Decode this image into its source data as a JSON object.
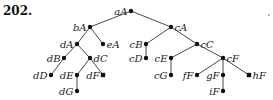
{
  "problem_number": "202.",
  "tree": {
    "nodes": [
      {
        "id": "aA",
        "label": "aA",
        "x": 131,
        "y": 11,
        "side": "left",
        "shape": "dot"
      },
      {
        "id": "bA",
        "label": "bA",
        "x": 90,
        "y": 27,
        "side": "left",
        "shape": "dot"
      },
      {
        "id": "cA",
        "label": "cA",
        "x": 171,
        "y": 27,
        "side": "right",
        "shape": "dot"
      },
      {
        "id": "dA",
        "label": "dA",
        "x": 77,
        "y": 44,
        "side": "left",
        "shape": "dot"
      },
      {
        "id": "eA",
        "label": "eA",
        "x": 103,
        "y": 44,
        "side": "right",
        "shape": "dot"
      },
      {
        "id": "cB",
        "label": "cB",
        "x": 146,
        "y": 44,
        "side": "left",
        "shape": "dot"
      },
      {
        "id": "cC",
        "label": "cC",
        "x": 197,
        "y": 44,
        "side": "right",
        "shape": "dot"
      },
      {
        "id": "dB",
        "label": "dB",
        "x": 64,
        "y": 58,
        "side": "left",
        "shape": "dot"
      },
      {
        "id": "dC",
        "label": "dC",
        "x": 90,
        "y": 58,
        "side": "right",
        "shape": "dot"
      },
      {
        "id": "cD",
        "label": "cD",
        "x": 146,
        "y": 58,
        "side": "left",
        "shape": "dot"
      },
      {
        "id": "cE",
        "label": "cE",
        "x": 171,
        "y": 58,
        "side": "left",
        "shape": "dot"
      },
      {
        "id": "cF",
        "label": "cF",
        "x": 223,
        "y": 58,
        "side": "right",
        "shape": "dot"
      },
      {
        "id": "dD",
        "label": "dD",
        "x": 51,
        "y": 75,
        "side": "left",
        "shape": "dot"
      },
      {
        "id": "dE",
        "label": "dE",
        "x": 77,
        "y": 75,
        "side": "left",
        "shape": "dot"
      },
      {
        "id": "dF",
        "label": "dF",
        "x": 103,
        "y": 75,
        "side": "left",
        "shape": "square"
      },
      {
        "id": "cG",
        "label": "cG",
        "x": 171,
        "y": 75,
        "side": "left",
        "shape": "dot"
      },
      {
        "id": "fF",
        "label": "fF",
        "x": 197,
        "y": 75,
        "side": "left",
        "shape": "dot"
      },
      {
        "id": "gF",
        "label": "gF",
        "x": 223,
        "y": 75,
        "side": "left",
        "shape": "dot"
      },
      {
        "id": "hF",
        "label": "hF",
        "x": 249,
        "y": 75,
        "side": "right",
        "shape": "square"
      },
      {
        "id": "dG",
        "label": "dG",
        "x": 77,
        "y": 91,
        "side": "left",
        "shape": "dot"
      },
      {
        "id": "iF",
        "label": "iF",
        "x": 223,
        "y": 91,
        "side": "left",
        "shape": "dot"
      }
    ],
    "edges": [
      [
        "aA",
        "bA"
      ],
      [
        "aA",
        "cA"
      ],
      [
        "bA",
        "dA"
      ],
      [
        "bA",
        "eA"
      ],
      [
        "cA",
        "cB"
      ],
      [
        "cA",
        "cC"
      ],
      [
        "dA",
        "dB"
      ],
      [
        "dA",
        "dC"
      ],
      [
        "cB",
        "cD"
      ],
      [
        "cC",
        "cE"
      ],
      [
        "cC",
        "cF"
      ],
      [
        "dB",
        "dD"
      ],
      [
        "dC",
        "dE"
      ],
      [
        "dC",
        "dF"
      ],
      [
        "cE",
        "cG"
      ],
      [
        "cF",
        "fF"
      ],
      [
        "cF",
        "gF"
      ],
      [
        "cF",
        "hF"
      ],
      [
        "dE",
        "dG"
      ],
      [
        "gF",
        "iF"
      ]
    ]
  },
  "stray_mark": {
    "x": 269,
    "y": 15
  }
}
